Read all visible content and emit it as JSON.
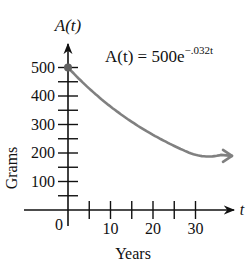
{
  "chart_data": {
    "type": "line",
    "title": "",
    "formula": "A(t) = 500e^{-.032t}",
    "formula_parts": {
      "lhs": "A(t) = 500e",
      "exponent": "−.032t"
    },
    "xlabel": "Years",
    "ylabel": "Grams",
    "x_axis_symbol": "t",
    "y_axis_symbol": "A(t)",
    "xlim": [
      0,
      40
    ],
    "ylim": [
      0,
      520
    ],
    "x_ticks": [
      5,
      10,
      15,
      20,
      25,
      30
    ],
    "x_tick_labels": [
      "10",
      "20",
      "30"
    ],
    "x_tick_label_values": [
      10,
      20,
      30
    ],
    "origin_label": "0",
    "y_ticks": [
      50,
      100,
      150,
      200,
      250,
      300,
      350,
      400,
      450,
      500
    ],
    "y_tick_labels": [
      "100",
      "200",
      "300",
      "400",
      "500"
    ],
    "y_tick_label_values": [
      100,
      200,
      300,
      400,
      500
    ],
    "grid": false,
    "series": [
      {
        "name": "A(t) = 500e^{-.032t}",
        "color": "#808080",
        "x": [
          0,
          5,
          10,
          15,
          20,
          25,
          30,
          35,
          39
        ],
        "y": [
          500,
          426,
          363,
          309,
          264,
          225,
          191,
          163,
          144
        ]
      }
    ],
    "point": {
      "t": 0,
      "A": 500,
      "color": "#606060"
    }
  }
}
